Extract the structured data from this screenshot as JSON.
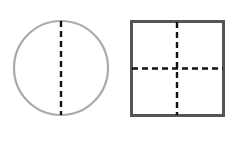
{
  "diagram": {
    "shapes": [
      {
        "type": "circle",
        "stroke": "#aaaaaa",
        "symmetry_lines": 1
      },
      {
        "type": "square",
        "stroke": "#555555",
        "symmetry_lines": 2
      }
    ],
    "dash_color": "#111111"
  }
}
